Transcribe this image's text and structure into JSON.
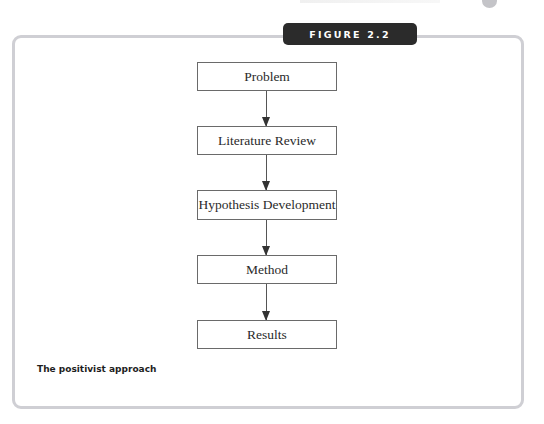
{
  "figure": {
    "label": "FIGURE 2.2",
    "caption": "The positivist approach"
  },
  "flowchart": {
    "steps": [
      {
        "label": "Problem"
      },
      {
        "label": "Literature Review"
      },
      {
        "label": "Hypothesis Development"
      },
      {
        "label": "Method"
      },
      {
        "label": "Results"
      }
    ],
    "connections": [
      {
        "from": "Problem",
        "to": "Literature Review"
      },
      {
        "from": "Literature Review",
        "to": "Hypothesis Development"
      },
      {
        "from": "Hypothesis Development",
        "to": "Method"
      },
      {
        "from": "Method",
        "to": "Results"
      }
    ]
  },
  "colors": {
    "tab_background": "#2b2b2b",
    "frame_border": "#cfcfd4",
    "box_border": "#6a6a6a"
  }
}
